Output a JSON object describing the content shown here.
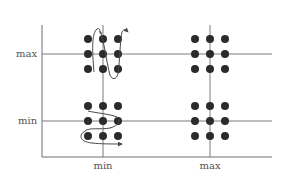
{
  "diagram": {
    "type": "parameter-grid",
    "x_axis": {
      "ticks": [
        {
          "id": "min",
          "label": "min"
        },
        {
          "id": "max",
          "label": "max"
        }
      ]
    },
    "y_axis": {
      "ticks": [
        {
          "id": "max",
          "label": "max"
        },
        {
          "id": "min",
          "label": "min"
        }
      ]
    },
    "clusters": [
      {
        "name": "cluster-minx-maxy",
        "x": "min",
        "y": "max",
        "dots": 9,
        "trajectory": "vertical-serpentine"
      },
      {
        "name": "cluster-maxx-maxy",
        "x": "max",
        "y": "max",
        "dots": 9,
        "trajectory": "none"
      },
      {
        "name": "cluster-minx-miny",
        "x": "min",
        "y": "min",
        "dots": 9,
        "trajectory": "horizontal-serpentine"
      },
      {
        "name": "cluster-maxx-miny",
        "x": "max",
        "y": "min",
        "dots": 9,
        "trajectory": "none"
      }
    ],
    "colors": {
      "dot": "#2b2b2b",
      "lines": "#7a7a7a",
      "labels": "#555555"
    }
  }
}
